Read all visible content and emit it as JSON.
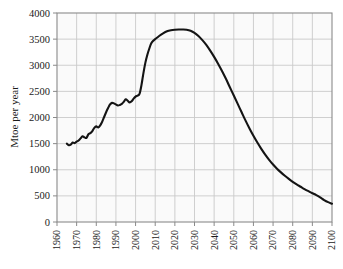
{
  "figure": {
    "background_color": "#ffffff",
    "plot_background_color": "#fafafa",
    "grid_color": "#c9c9c9",
    "axis_color": "#8a8a8a",
    "line_color": "#141414"
  },
  "chart_data": {
    "type": "line",
    "title": "",
    "subtitle": "",
    "xlabel": "",
    "ylabel": "Mtoe per year",
    "xlim": [
      1960,
      2100
    ],
    "ylim": [
      0,
      4000
    ],
    "grid": true,
    "legend": null,
    "legend_position": "none",
    "xticks": [
      1960,
      1970,
      1980,
      1990,
      2000,
      2010,
      2020,
      2030,
      2040,
      2050,
      2060,
      2070,
      2080,
      2090,
      2100
    ],
    "xtick_labels": [
      "1960",
      "1970",
      "1980",
      "1990",
      "2000",
      "2010",
      "2020",
      "2030",
      "2040",
      "2050",
      "2060",
      "2070",
      "2080",
      "2090",
      "2100"
    ],
    "xtick_rotation": 90,
    "yticks": [
      0,
      500,
      1000,
      1500,
      2000,
      2500,
      3000,
      3500,
      4000
    ],
    "ytick_labels": [
      "0",
      "500",
      "1000",
      "1500",
      "2000",
      "2500",
      "3000",
      "3500",
      "4000"
    ],
    "series": [
      {
        "name": "Production",
        "line_color": "#141414",
        "line_width": 2.1,
        "x": [
          1965,
          1966,
          1967,
          1968,
          1969,
          1970,
          1971,
          1972,
          1973,
          1974,
          1975,
          1976,
          1977,
          1978,
          1979,
          1980,
          1981,
          1982,
          1983,
          1984,
          1985,
          1986,
          1987,
          1988,
          1989,
          1990,
          1991,
          1992,
          1993,
          1994,
          1995,
          1996,
          1997,
          1998,
          1999,
          2000,
          2001,
          2002,
          2003,
          2004,
          2005,
          2006,
          2007,
          2008,
          2009,
          2010,
          2012,
          2014,
          2016,
          2018,
          2020,
          2022,
          2024,
          2026,
          2028,
          2030,
          2032,
          2034,
          2036,
          2038,
          2040,
          2042,
          2044,
          2046,
          2048,
          2050,
          2052,
          2054,
          2056,
          2058,
          2060,
          2062,
          2064,
          2066,
          2068,
          2070,
          2072,
          2074,
          2076,
          2078,
          2080,
          2082,
          2084,
          2086,
          2088,
          2090,
          2092,
          2094,
          2096,
          2098,
          2100
        ],
        "y": [
          1500,
          1470,
          1480,
          1520,
          1510,
          1540,
          1560,
          1600,
          1640,
          1620,
          1610,
          1680,
          1700,
          1740,
          1800,
          1830,
          1810,
          1850,
          1920,
          2010,
          2100,
          2180,
          2250,
          2280,
          2270,
          2250,
          2230,
          2240,
          2260,
          2300,
          2350,
          2320,
          2290,
          2310,
          2360,
          2400,
          2420,
          2450,
          2620,
          2850,
          3050,
          3200,
          3320,
          3420,
          3470,
          3500,
          3560,
          3610,
          3650,
          3670,
          3680,
          3685,
          3685,
          3680,
          3660,
          3620,
          3560,
          3480,
          3390,
          3280,
          3160,
          3030,
          2890,
          2740,
          2580,
          2420,
          2260,
          2100,
          1940,
          1790,
          1650,
          1520,
          1400,
          1290,
          1190,
          1100,
          1020,
          950,
          885,
          825,
          770,
          720,
          675,
          630,
          590,
          550,
          515,
          470,
          420,
          380,
          350
        ]
      }
    ]
  }
}
